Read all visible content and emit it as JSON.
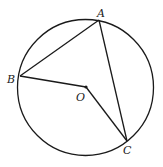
{
  "diagram": {
    "type": "geometry",
    "circle": {
      "center": "O",
      "cx": 85.5,
      "cy": 87.5,
      "r": 68
    },
    "points": {
      "A": {
        "label": "A",
        "x": 99,
        "y": 20
      },
      "B": {
        "label": "B",
        "x": 20,
        "y": 76
      },
      "C": {
        "label": "C",
        "x": 127,
        "y": 141
      },
      "O": {
        "label": "O",
        "x": 86,
        "y": 87
      }
    },
    "segments": [
      [
        "A",
        "B"
      ],
      [
        "A",
        "C"
      ],
      [
        "B",
        "O"
      ],
      [
        "O",
        "C"
      ]
    ],
    "stroke_color": "#1a1a1a",
    "label_positions": {
      "A": {
        "x": 97,
        "y": 17
      },
      "B": {
        "x": 7,
        "y": 83
      },
      "O": {
        "x": 76,
        "y": 101
      },
      "C": {
        "x": 123,
        "y": 154
      }
    }
  }
}
